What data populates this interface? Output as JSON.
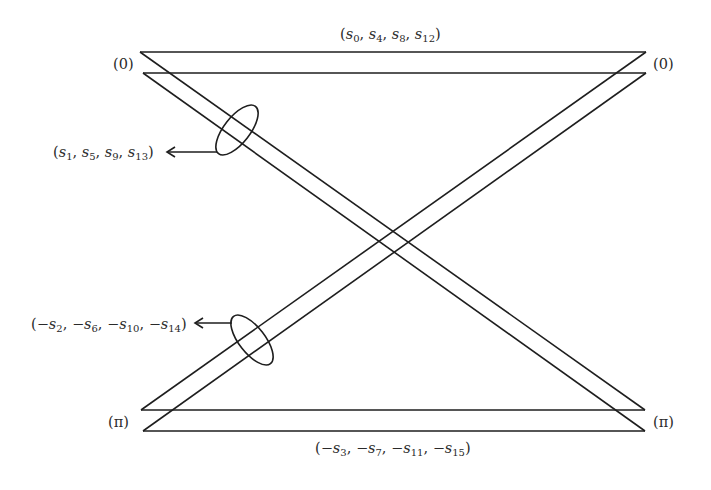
{
  "diagram": {
    "type": "signal-flow / butterfly-like crossover",
    "node_labels": {
      "top_left": "(0)",
      "top_right": "(0)",
      "bottom_left": "(π)",
      "bottom_right": "(π)"
    },
    "group_labels": {
      "top": {
        "prefix": "",
        "terms": [
          [
            "s",
            "0"
          ],
          [
            "s",
            "4"
          ],
          [
            "s",
            "8"
          ],
          [
            "s",
            "12"
          ]
        ]
      },
      "upper_left": {
        "prefix": "",
        "terms": [
          [
            "s",
            "1"
          ],
          [
            "s",
            "5"
          ],
          [
            "s",
            "9"
          ],
          [
            "s",
            "13"
          ]
        ]
      },
      "lower_left": {
        "prefix": "−",
        "terms": [
          [
            "s",
            "2"
          ],
          [
            "s",
            "6"
          ],
          [
            "s",
            "10"
          ],
          [
            "s",
            "14"
          ]
        ]
      },
      "bottom": {
        "prefix": "−",
        "terms": [
          [
            "s",
            "3"
          ],
          [
            "s",
            "7"
          ],
          [
            "s",
            "11"
          ],
          [
            "s",
            "15"
          ]
        ]
      }
    },
    "text": {
      "top": "(s0, s4, s8, s12)",
      "upper_left": "(s1, s5, s9, s13)",
      "lower_left": "(−s2, −s6, −s10, −s14)",
      "bottom": "(−s3, −s7, −s11, −s15)"
    },
    "colors": {
      "stroke": "#1e1e1e",
      "text": "#2a2a2a",
      "background": "#ffffff"
    }
  }
}
